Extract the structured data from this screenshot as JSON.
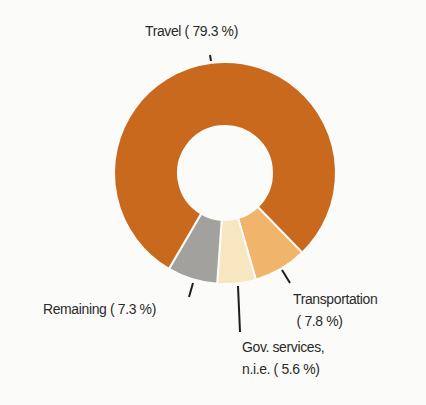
{
  "chart_data": {
    "type": "pie",
    "subtype": "donut",
    "title": "",
    "categories": [
      "Travel",
      "Transportation",
      "Gov. services, n.i.e.",
      "Remaining"
    ],
    "values": [
      79.3,
      7.8,
      5.6,
      7.3
    ],
    "unit": "%",
    "colors": [
      "#c8691e",
      "#f0b46a",
      "#f7e6bf",
      "#a3a19e"
    ],
    "labels": [
      {
        "lines": [
          "Travel ( 79.3 %)"
        ]
      },
      {
        "lines": [
          "Transportation",
          "( 7.8 %)"
        ]
      },
      {
        "lines": [
          "Gov. services,",
          "n.i.e. ( 5.6 %)"
        ]
      },
      {
        "lines": [
          "Remaining (  7.3 %)"
        ]
      }
    ],
    "legend": "none (direct labels with leader lines)",
    "geometry": {
      "cx": 225,
      "cy": 173,
      "outer_radius": 111,
      "inner_radius": 47,
      "start_angle_deg_clockwise_from_top": 135.8,
      "order_clockwise": [
        "Transportation",
        "Gov. services, n.i.e.",
        "Remaining",
        "Travel"
      ]
    }
  },
  "labels": {
    "travel": "Travel ( 79.3 %)",
    "transportation_line1": "Transportation",
    "transportation_line2": "( 7.8 %)",
    "gov_line1": "Gov. services,",
    "gov_line2": "n.i.e. ( 5.6 %)",
    "remaining": "Remaining (  7.3 %)"
  },
  "leaders": [
    {
      "name": "travel",
      "x1": 210,
      "y1": 55,
      "x2": 211,
      "y2": 61
    },
    {
      "name": "transportation",
      "x1": 282,
      "y1": 270,
      "x2": 290,
      "y2": 283
    },
    {
      "name": "gov",
      "x1": 238,
      "y1": 286,
      "x2": 240,
      "y2": 332
    },
    {
      "name": "remaining",
      "x1": 193,
      "y1": 283,
      "x2": 189,
      "y2": 297
    }
  ]
}
